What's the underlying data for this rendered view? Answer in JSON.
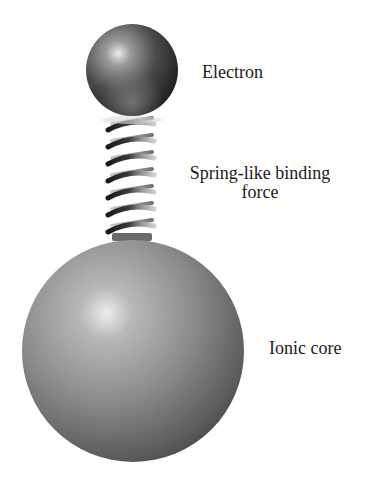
{
  "diagram": {
    "components": [
      {
        "id": "electron",
        "shape": "sphere",
        "label": "Electron"
      },
      {
        "id": "spring",
        "shape": "coil-spring",
        "label_line1": "Spring-like binding",
        "label_line2": "force",
        "coils": 7
      },
      {
        "id": "ionic_core",
        "shape": "sphere",
        "label": "Ionic core"
      }
    ],
    "labels": {
      "electron": "Electron",
      "spring_line1": "Spring-like binding",
      "spring_line2": "force",
      "core": "Ionic core"
    },
    "colors": {
      "background": "#ffffff",
      "electron_dark": "#2a2a2a",
      "electron_highlight": "#e8e8e8",
      "core_mid": "#8c8c8c",
      "core_dark": "#4a4a4a",
      "core_highlight": "#e6e6e6",
      "spring_dark": "#1e1e1e",
      "spring_light": "#c8c8c8",
      "text": "#1a1a1a"
    }
  }
}
